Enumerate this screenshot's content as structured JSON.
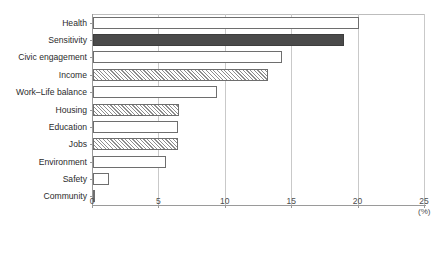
{
  "chart_data": {
    "type": "bar",
    "orientation": "horizontal",
    "title": "",
    "xlabel": "(%)",
    "ylabel": "",
    "xlim": [
      0,
      25
    ],
    "xticks": [
      "0",
      "5",
      "10",
      "15",
      "20",
      "25"
    ],
    "xtick_values": [
      0,
      5,
      10,
      15,
      20,
      25
    ],
    "grid": "vertical",
    "legend": "none",
    "categories": [
      "Health",
      "Sensitivity",
      "Civic engagement",
      "Income",
      "Work–Life balance",
      "Housing",
      "Education",
      "Jobs",
      "Environment",
      "Safety",
      "Community"
    ],
    "values": [
      20.0,
      18.9,
      14.2,
      13.2,
      9.3,
      6.5,
      6.4,
      6.4,
      5.5,
      1.2,
      0.1
    ],
    "bar_styles": [
      "hollow",
      "solid",
      "hollow",
      "hatch",
      "hollow",
      "hatch",
      "hollow",
      "hatch",
      "hollow",
      "hollow",
      "hollow"
    ],
    "colors": {
      "solid_fill": "#4a4a4a",
      "hollow_fill": "#ffffff",
      "hatch_line": "#8e8e8e",
      "bar_edge": "#6e6e6e",
      "axis": "#9a9a9a",
      "gridline": "#c9c9c9",
      "text": "#2b2b2b"
    }
  },
  "background_bleed": [
    {
      "text": "",
      "x": 372,
      "y": 64
    },
    {
      "text": "",
      "x": 370,
      "y": 78
    },
    {
      "text": "",
      "x": 368,
      "y": 100
    },
    {
      "text": "",
      "x": 366,
      "y": 122
    },
    {
      "text": "",
      "x": 366,
      "y": 142
    },
    {
      "text": "",
      "x": 368,
      "y": 164
    },
    {
      "text": "",
      "x": 60,
      "y": 244
    }
  ]
}
